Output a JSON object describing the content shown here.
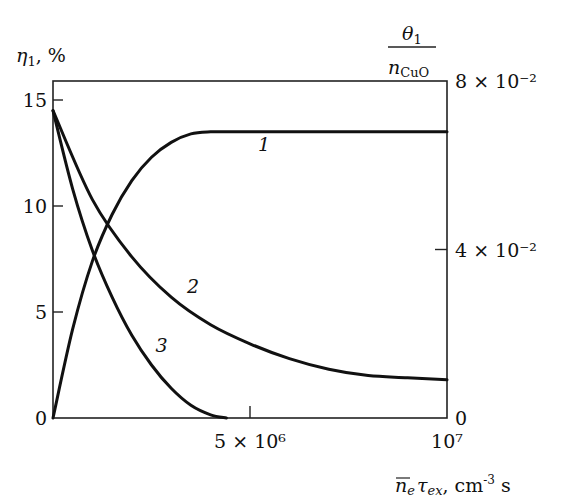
{
  "chart_data": {
    "type": "line",
    "title": "",
    "xlabel": "n̄e τex, cm⁻³ s",
    "ylabel_left": "η1, %",
    "ylabel_right": "θ1 / nCuO",
    "xlim": [
      0,
      10000000
    ],
    "ylim_left": [
      0,
      16
    ],
    "ylim_right": [
      0,
      0.08
    ],
    "grid": false,
    "legend": "inline curve numbers",
    "x_ticks": [
      {
        "value": 0,
        "label": ""
      },
      {
        "value": 5000000,
        "label": "5 × 10⁶"
      },
      {
        "value": 10000000,
        "label": "10⁷"
      }
    ],
    "y_ticks_left": [
      {
        "value": 0,
        "label": "0"
      },
      {
        "value": 5,
        "label": "5"
      },
      {
        "value": 10,
        "label": "10"
      },
      {
        "value": 15,
        "label": "15"
      }
    ],
    "y_ticks_right": [
      {
        "value": 0,
        "label": "0"
      },
      {
        "value": 0.04,
        "label": "4 × 10⁻²"
      },
      {
        "value": 0.08,
        "label": "8 × 10⁻²"
      }
    ],
    "series": [
      {
        "name": "1",
        "axis": "left",
        "x": [
          0,
          500000,
          1000000,
          1500000,
          2000000,
          2500000,
          3000000,
          3500000,
          4000000,
          4500000,
          5000000,
          7500000,
          10000000
        ],
        "values": [
          0,
          4.2,
          7.4,
          9.6,
          11.2,
          12.3,
          13.0,
          13.4,
          13.5,
          13.5,
          13.5,
          13.5,
          13.5
        ]
      },
      {
        "name": "2",
        "axis": "left",
        "x": [
          0,
          1000000,
          2000000,
          3000000,
          4000000,
          5000000,
          6000000,
          7000000,
          8000000,
          9000000,
          10000000
        ],
        "values": [
          14.5,
          10.3,
          7.6,
          5.7,
          4.4,
          3.5,
          2.8,
          2.3,
          2.0,
          1.9,
          1.8
        ]
      },
      {
        "name": "3",
        "axis": "left",
        "x": [
          0,
          500000,
          1000000,
          1500000,
          2000000,
          2500000,
          3000000,
          3500000,
          4000000,
          4400000
        ],
        "values": [
          14.5,
          10.8,
          7.9,
          5.7,
          3.9,
          2.5,
          1.4,
          0.6,
          0.15,
          0
        ]
      }
    ],
    "curve_labels": [
      {
        "text": "1",
        "x": 5200000,
        "y": 12.6
      },
      {
        "text": "2",
        "x": 3400000,
        "y": 5.9
      },
      {
        "text": "3",
        "x": 2600000,
        "y": 3.1
      }
    ]
  },
  "labels": {
    "y_left_symbol": "η",
    "y_left_sub": "1",
    "y_left_unit": ",  %",
    "y_right_num_symbol": "θ",
    "y_right_num_sub": "1",
    "y_right_den_symbol": "n",
    "y_right_den_sub": "CuO",
    "x_symbol_n": "n",
    "x_sub_e": "e",
    "x_symbol_tau": "τ",
    "x_sub_ex": "ex",
    "x_unit": ", cm",
    "x_unit_exp": "-3",
    "x_unit_tail": " s"
  }
}
